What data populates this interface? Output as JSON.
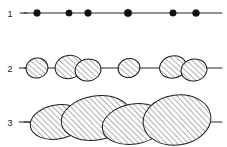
{
  "figure": {
    "background_color": "#ffffff",
    "line_color": "#262626",
    "dot_color": "#111111",
    "hatch_color": "#3a3a3a",
    "width": 227,
    "height": 147
  },
  "rows": [
    {
      "id": "row-1",
      "label": "1",
      "label_x": 10,
      "label_y": 14,
      "axis": {
        "x1": 24,
        "x2": 222,
        "y": 13
      },
      "style": "dots",
      "dots": [
        {
          "cx": 37,
          "cy": 13,
          "r": 3.4
        },
        {
          "cx": 69,
          "cy": 13,
          "r": 3.2
        },
        {
          "cx": 88,
          "cy": 13,
          "r": 3.4
        },
        {
          "cx": 128,
          "cy": 13,
          "r": 3.8
        },
        {
          "cx": 173,
          "cy": 13,
          "r": 3.3
        },
        {
          "cx": 196,
          "cy": 13,
          "r": 3.5
        }
      ]
    },
    {
      "id": "row-2",
      "label": "2",
      "label_x": 10,
      "label_y": 72,
      "axis": {
        "x1": 24,
        "x2": 222,
        "y": 68
      },
      "style": "small-blobs",
      "blobs": [
        {
          "cx": 37,
          "cy": 68,
          "rx": 11,
          "ry": 10,
          "rot": -14
        },
        {
          "cx": 69,
          "cy": 67,
          "rx": 14,
          "ry": 11.5,
          "rot": -13
        },
        {
          "cx": 88,
          "cy": 70,
          "rx": 13,
          "ry": 11,
          "rot": -12
        },
        {
          "cx": 129,
          "cy": 68,
          "rx": 11,
          "ry": 9.5,
          "rot": -14
        },
        {
          "cx": 173,
          "cy": 67,
          "rx": 13.5,
          "ry": 11,
          "rot": -13
        },
        {
          "cx": 194,
          "cy": 70,
          "rx": 13,
          "ry": 11,
          "rot": -12
        }
      ]
    },
    {
      "id": "row-3",
      "label": "3",
      "label_x": 10,
      "label_y": 126,
      "axis": {
        "x1": 24,
        "x2": 222,
        "y": 122
      },
      "style": "large-blobs",
      "blobs": [
        {
          "cx": 57,
          "cy": 122,
          "rx": 27,
          "ry": 17,
          "rot": -10
        },
        {
          "cx": 96,
          "cy": 118,
          "rx": 35,
          "ry": 22,
          "rot": -9
        },
        {
          "cx": 134,
          "cy": 124,
          "rx": 32,
          "ry": 20,
          "rot": -10
        },
        {
          "cx": 177,
          "cy": 120,
          "rx": 34,
          "ry": 25,
          "rot": -8
        }
      ]
    }
  ],
  "legend": {
    "description": "Row 1: point particles on a line. Row 2: small hatched ellipsoids, some fused in pairs. Row 3: large fused hatched ellipsoids forming a chain."
  }
}
